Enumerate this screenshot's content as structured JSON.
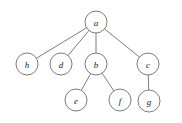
{
  "figure": {
    "background_color": "#ffffff",
    "node_stroke_color": "#6e6e6e",
    "node_fill_color": "#ffffff",
    "edge_color": "#6e6e6e",
    "label_color": "#1a1a1a"
  },
  "chart_data": {
    "type": "diagram",
    "diagram_kind": "rooted-tree",
    "title": "",
    "root": "a",
    "nodes": [
      {
        "id": "a",
        "label": "a",
        "cx": 96,
        "cy": 22,
        "r": 11,
        "depth": 0
      },
      {
        "id": "h",
        "label": "h",
        "cx": 27,
        "cy": 64,
        "r": 11,
        "depth": 1
      },
      {
        "id": "d",
        "label": "d",
        "cx": 61,
        "cy": 64,
        "r": 11,
        "depth": 1
      },
      {
        "id": "b",
        "label": "b",
        "cx": 96,
        "cy": 64,
        "r": 11,
        "depth": 1
      },
      {
        "id": "c",
        "label": "c",
        "cx": 148,
        "cy": 64,
        "r": 11,
        "depth": 1
      },
      {
        "id": "e",
        "label": "e",
        "cx": 76,
        "cy": 100,
        "r": 11,
        "depth": 2
      },
      {
        "id": "f",
        "label": "f",
        "cx": 120,
        "cy": 100,
        "r": 11,
        "depth": 2
      },
      {
        "id": "g",
        "label": "g",
        "cx": 149,
        "cy": 101,
        "r": 11,
        "depth": 2
      }
    ],
    "edges": [
      {
        "from": "a",
        "to": "h"
      },
      {
        "from": "a",
        "to": "d"
      },
      {
        "from": "a",
        "to": "b"
      },
      {
        "from": "a",
        "to": "c"
      },
      {
        "from": "b",
        "to": "e"
      },
      {
        "from": "b",
        "to": "f"
      },
      {
        "from": "c",
        "to": "g"
      }
    ]
  }
}
